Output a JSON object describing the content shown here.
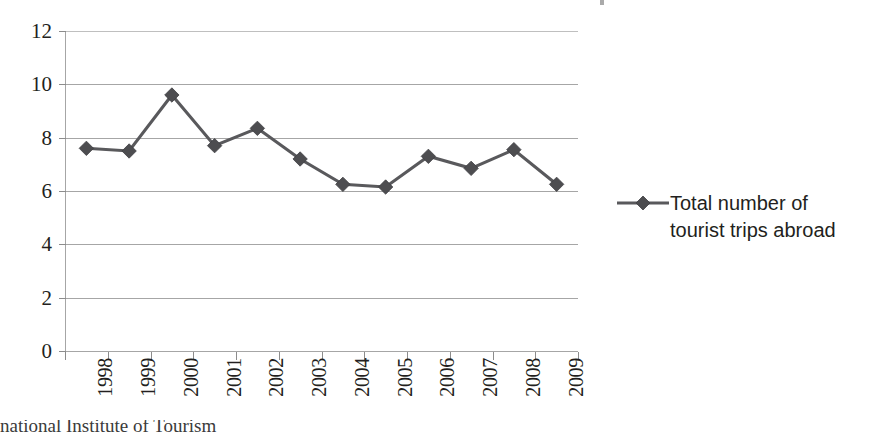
{
  "chart_data": {
    "type": "line",
    "title": "",
    "subtitle": "",
    "xlabel": "",
    "ylabel": "",
    "categories": [
      "1998",
      "1999",
      "2000",
      "2001",
      "2002",
      "2003",
      "2004",
      "2005",
      "2006",
      "2007",
      "2008",
      "2009"
    ],
    "series": [
      {
        "name": "Total number of tourist trips abroad",
        "values": [
          7.6,
          7.5,
          9.6,
          7.7,
          8.35,
          7.2,
          6.25,
          6.15,
          7.3,
          6.85,
          7.55,
          6.25
        ],
        "marker": "diamond",
        "color": "#59595c"
      }
    ],
    "ylim": [
      0,
      12
    ],
    "ytick_values": [
      0,
      2,
      4,
      6,
      8,
      10,
      12
    ],
    "ytick_labels": [
      "0",
      "2",
      "4",
      "6",
      "8",
      "10",
      "12"
    ],
    "grid": true,
    "grid_axis": "y",
    "legend_position": "right",
    "legend_entries": [
      "Total number of tourist trips abroad"
    ],
    "xtick_rotation": 90,
    "annotations": []
  },
  "axes": {
    "y_labels": [
      "12",
      "10",
      "8",
      "6",
      "4",
      "2",
      "0"
    ],
    "x_labels": [
      "1998",
      "1999",
      "2000",
      "2001",
      "2002",
      "2003",
      "2004",
      "2005",
      "2006",
      "2007",
      "2008",
      "2009"
    ]
  },
  "legend": {
    "label": "Total number of tourist trips abroad",
    "marker_color": "#59595c"
  },
  "source_note": {
    "text": "national Institute of Tourism"
  },
  "colors": {
    "series": "#59595c",
    "gridline": "#a6a6a6",
    "text": "#231f20",
    "background": "#ffffff"
  }
}
